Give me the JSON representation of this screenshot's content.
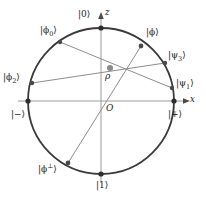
{
  "figure": {
    "type": "bloch-sphere-cross-section",
    "colors": {
      "circle": "#3a3a3a",
      "chord": "#8a8a8a",
      "axis": "#9a9a9a",
      "point": "#3a3a3a",
      "rho_point": "#7a7a7a",
      "text": "#1a1a1a",
      "background": "#ffffff"
    },
    "geometry": {
      "center_x": 101,
      "center_y": 101,
      "radius": 73
    },
    "axes": [
      {
        "name": "x-axis",
        "label": "x",
        "direction": "horizontal",
        "arrow": "right"
      },
      {
        "name": "z-axis",
        "label": "z",
        "direction": "vertical",
        "arrow": "up"
      }
    ],
    "origin_label": "O",
    "rho_label": "ρ",
    "points": [
      {
        "name": "ket-0",
        "label": "|0⟩",
        "x": 101,
        "y": 28,
        "marker": true
      },
      {
        "name": "ket-1",
        "label": "|1⟩",
        "x": 101,
        "y": 174,
        "marker": true
      },
      {
        "name": "ket-plus",
        "label": "|+⟩",
        "x": 174,
        "y": 101,
        "marker": true
      },
      {
        "name": "ket-minus",
        "label": "|−⟩",
        "x": 28,
        "y": 101,
        "marker": true
      },
      {
        "name": "ket-phi",
        "label": "|ϕ⟩",
        "x": 141,
        "y": 46,
        "marker": true
      },
      {
        "name": "ket-phi-perp",
        "label": "|ϕ⊥⟩",
        "x": 68,
        "y": 163,
        "marker": true
      },
      {
        "name": "ket-phi-0",
        "label": "|ϕ₀⟩",
        "x": 60,
        "y": 42,
        "marker": true
      },
      {
        "name": "ket-phi-2",
        "label": "|ϕ₂⟩",
        "x": 32,
        "y": 83,
        "marker": true
      },
      {
        "name": "ket-psi-1",
        "label": "|ψ₁⟩",
        "x": 172,
        "y": 88,
        "marker": true
      },
      {
        "name": "ket-psi-3",
        "label": "|ψ₃⟩",
        "x": 165,
        "y": 63,
        "marker": true
      },
      {
        "name": "rho",
        "label": "ρ",
        "x": 110,
        "y": 68,
        "marker": true
      }
    ],
    "chords": [
      {
        "name": "chord-phi-to-phi-perp",
        "from": "ket-phi",
        "to": "ket-phi-perp"
      },
      {
        "name": "chord-phi0-to-psi1",
        "from": "ket-phi-0",
        "to": "ket-psi-1"
      },
      {
        "name": "chord-phi2-to-psi3",
        "from": "ket-phi-2",
        "to": "ket-psi-3"
      }
    ],
    "labels": {
      "ket_0": "|0⟩",
      "ket_1": "|1⟩",
      "ket_plus": "|+⟩",
      "ket_minus": "|−⟩",
      "ket_phi": "|ϕ⟩",
      "ket_phi_perp_base": "|ϕ",
      "ket_phi_perp_sup": "⊥",
      "ket_phi_perp_close": "⟩",
      "ket_phi_0_base": "|ϕ",
      "ket_phi_0_sub": "0",
      "ket_phi_0_close": "⟩",
      "ket_phi_2_base": "|ϕ",
      "ket_phi_2_sub": "2",
      "ket_phi_2_close": "⟩",
      "ket_psi_1_base": "|ψ",
      "ket_psi_1_sub": "1",
      "ket_psi_1_close": "⟩",
      "ket_psi_3_base": "|ψ",
      "ket_psi_3_sub": "3",
      "ket_psi_3_close": "⟩",
      "origin": "O",
      "rho": "ρ",
      "axis_x": "x",
      "axis_z": "z"
    }
  }
}
